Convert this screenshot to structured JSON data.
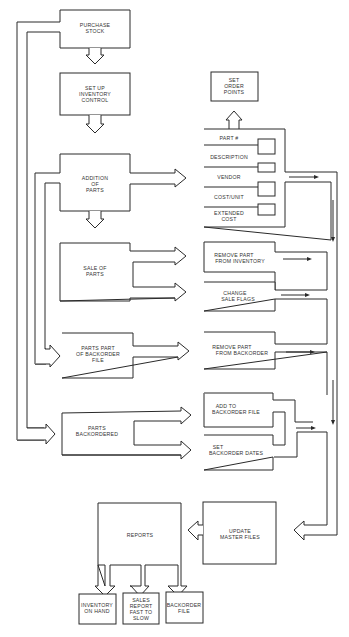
{
  "diagram": {
    "type": "flowchart",
    "title": "",
    "left_column": {
      "purchase_stock": [
        "PURCHASE",
        "STOCK"
      ],
      "setup_inventory": [
        "SET UP",
        "INVENTORY",
        "CONTROL"
      ],
      "addition_of_parts": [
        "ADDITION",
        "OF",
        "PARTS"
      ],
      "sale_of_parts": [
        "SALE OF",
        "PARTS"
      ],
      "parts_part_of_backorder": [
        "PARTS PART",
        "OF BACKORDER",
        "FILE"
      ],
      "parts_backordered": [
        "PARTS",
        "BACKORDERED"
      ],
      "reports": [
        "REPORTS"
      ]
    },
    "right_column": {
      "set_order_points": [
        "SET",
        "ORDER",
        "POINTS"
      ],
      "part_record_fields": [
        [
          "PART #"
        ],
        [
          "DESCRIPTION"
        ],
        [
          "VENDOR"
        ],
        [
          "COST/UNIT"
        ],
        [
          "EXTENDED",
          "COST"
        ]
      ],
      "remove_part_from_inventory": [
        "REMOVE PART",
        "FROM INVENTORY"
      ],
      "change_sale_flags": [
        "CHANGE",
        "SALE FLAGS"
      ],
      "remove_part_from_backorder": [
        "REMOVE PART",
        "FROM BACKORDER"
      ],
      "add_to_backorder_file": [
        "ADD TO",
        "BACKORDER FILE"
      ],
      "set_backorder_dates": [
        "SET",
        "BACKORDER DATES"
      ],
      "update_master_files": [
        "UPDATE",
        "MASTER FILES"
      ]
    },
    "report_outputs": [
      [
        "INVENTORY",
        "ON HAND"
      ],
      [
        "SALES",
        "REPORT",
        "FAST TO",
        "SLOW"
      ],
      [
        "BACKORDER",
        "FILE"
      ]
    ],
    "colors": {
      "line": "#2a2a2a",
      "text": "#333333",
      "background": "#ffffff"
    }
  }
}
